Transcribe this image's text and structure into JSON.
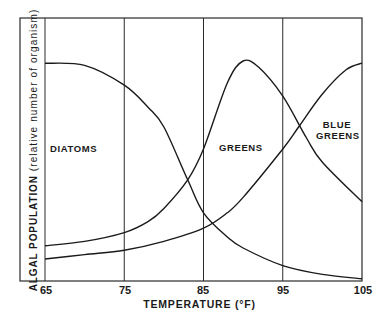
{
  "chart_data": {
    "type": "line",
    "title": "",
    "xlabel": "TEMPERATURE (°F)",
    "ylabel": "ALGAL POPULATION",
    "ylabel_sub": "(relative number of organism)",
    "xlim": [
      65,
      105
    ],
    "ylim": [
      0,
      100
    ],
    "x_ticks": [
      65,
      75,
      85,
      95,
      105
    ],
    "x_tick_labels": [
      "65",
      "75",
      "85",
      "95",
      "105"
    ],
    "y_ticks": [],
    "grid": "vertical lines at 75, 85, 95",
    "legend": "none (inline labels)",
    "series": [
      {
        "name": "DIATOMS",
        "x": [
          65,
          70,
          75,
          78,
          80,
          83,
          85,
          88,
          90,
          95,
          100,
          105
        ],
        "values": [
          99,
          98,
          89,
          79,
          70,
          46,
          31,
          20,
          15,
          7,
          3,
          1
        ]
      },
      {
        "name": "GREENS",
        "x": [
          65,
          70,
          75,
          78,
          80,
          83,
          85,
          88,
          90,
          92,
          95,
          98,
          100,
          105
        ],
        "values": [
          16,
          18,
          22,
          27,
          33,
          46,
          60,
          90,
          100,
          97,
          84,
          65,
          54,
          36
        ]
      },
      {
        "name": "BLUE GREENS",
        "x": [
          65,
          70,
          75,
          80,
          85,
          88,
          90,
          95,
          97,
          100,
          103,
          105
        ],
        "values": [
          10,
          12,
          14,
          18,
          24,
          31,
          38,
          60,
          70,
          85,
          96,
          99
        ]
      }
    ],
    "annotations": [
      {
        "text": "DIATOMS",
        "x": 67,
        "y": 60
      },
      {
        "text": "GREENS",
        "x": 87,
        "y": 61
      },
      {
        "text": "BLUE GREENS",
        "x": 100,
        "y": 70
      }
    ]
  },
  "labels": {
    "diatoms": "DIATOMS",
    "greens": "GREENS",
    "blue": "BLUE",
    "greens2": "GREENS"
  },
  "axis": {
    "xlabel": "TEMPERATURE (°F)",
    "ylabel_main": "ALGAL  POPULATION",
    "ylabel_sub": " (relative number of organism)",
    "ticks": [
      "65",
      "75",
      "85",
      "95",
      "105"
    ]
  }
}
